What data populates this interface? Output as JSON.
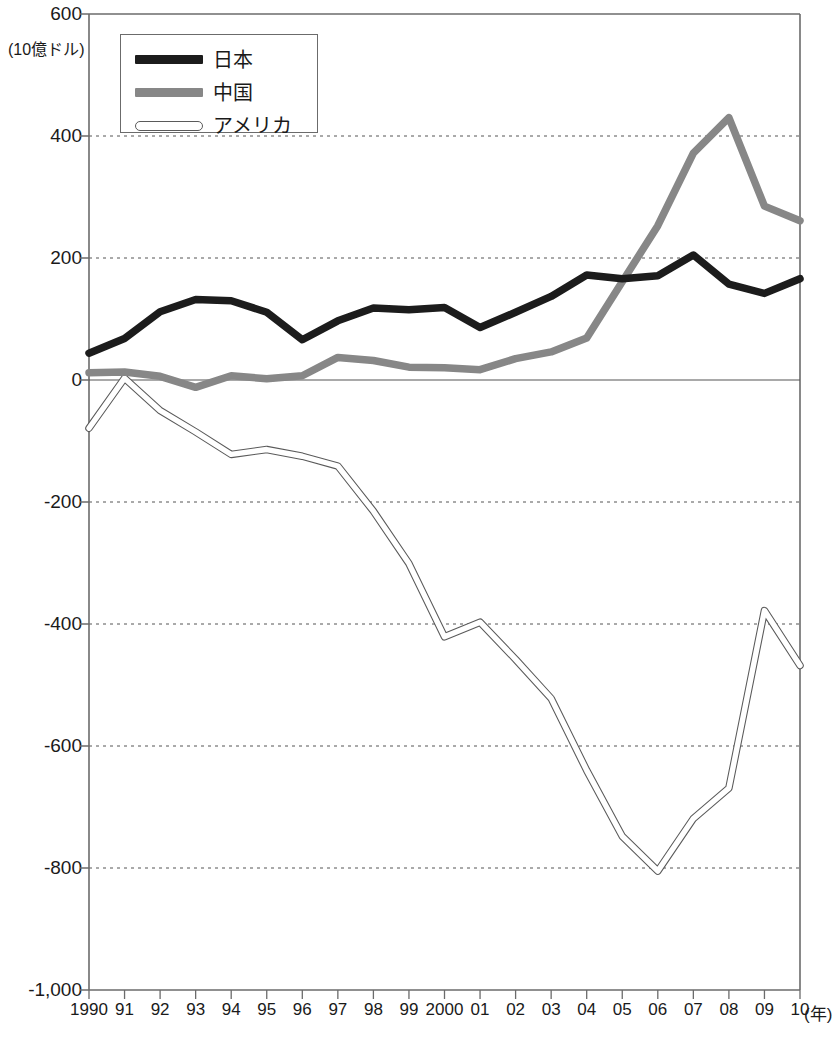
{
  "chart_data": {
    "type": "line",
    "title": "",
    "subtitle": "",
    "xlabel": "(年)",
    "ylabel": "(10億ドル)",
    "unit_label": "(10億ドル)",
    "x_unit_label": "(年)",
    "grid": true,
    "legend_position": "top-left",
    "ylim": [
      -1000,
      600
    ],
    "y_ticks": [
      600,
      400,
      200,
      0,
      -200,
      -400,
      -600,
      -800,
      -1000
    ],
    "y_tick_labels": [
      "600",
      "400",
      "200",
      "0",
      "-200",
      "-400",
      "-600",
      "-800",
      "-1,000"
    ],
    "x": [
      1990,
      1991,
      1992,
      1993,
      1994,
      1995,
      1996,
      1997,
      1998,
      1999,
      2000,
      2001,
      2002,
      2003,
      2004,
      2005,
      2006,
      2007,
      2008,
      2009,
      2010
    ],
    "categories": [
      "1990",
      "91",
      "92",
      "93",
      "94",
      "95",
      "96",
      "97",
      "98",
      "99",
      "2000",
      "01",
      "02",
      "03",
      "04",
      "05",
      "06",
      "07",
      "08",
      "09",
      "10"
    ],
    "series": [
      {
        "name": "日本",
        "color": "#1c1c1c",
        "style": "thick-solid",
        "values": [
          44,
          68,
          112,
          132,
          130,
          111,
          66,
          97,
          118,
          115,
          119,
          86,
          111,
          137,
          172,
          166,
          171,
          205,
          157,
          142,
          166
        ]
      },
      {
        "name": "中国",
        "color": "#878787",
        "style": "thick-solid",
        "values": [
          12,
          13,
          6,
          -12,
          7,
          2,
          7,
          37,
          32,
          21,
          20,
          17,
          35,
          46,
          69,
          161,
          253,
          372,
          430,
          285,
          261
        ]
      },
      {
        "name": "アメリカ",
        "color": "#ffffff",
        "outline": "#5a5a5a",
        "style": "hollow-outline",
        "values": [
          -79,
          3,
          -50,
          -85,
          -122,
          -114,
          -125,
          -141,
          -215,
          -301,
          -421,
          -397,
          -458,
          -522,
          -640,
          -748,
          -805,
          -719,
          -669,
          -378,
          -468
        ]
      }
    ]
  },
  "legend": {
    "items": [
      {
        "label": "日本",
        "swatch": "thick-black-line"
      },
      {
        "label": "中国",
        "swatch": "thick-gray-line"
      },
      {
        "label": "アメリカ",
        "swatch": "hollow-outline-line"
      }
    ]
  },
  "colors": {
    "japan": "#1c1c1c",
    "china": "#878787",
    "usa_outline": "#5a5a5a",
    "axis": "#6b6b6b",
    "grid": "#555555",
    "background": "#ffffff"
  }
}
